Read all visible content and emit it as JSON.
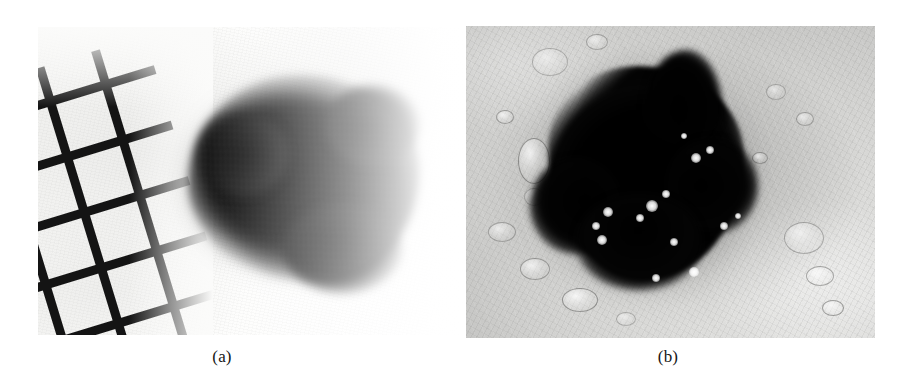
{
  "figure": {
    "kind": "two-panel-medical-figure",
    "background_color": "#ffffff",
    "panels": [
      {
        "id": "a",
        "caption": "(a)",
        "modality": "clinical-photograph",
        "subject": "pigmented skin lesion (melanoma) with measuring mesh grid",
        "background_color": "#fbfbfa",
        "lesion_color": "#0a0a0a",
        "has_measurement_grid": true,
        "grid_color": "#141414",
        "grid_rotation_deg": -17,
        "border_quality": "fuzzy, irregular, feathered",
        "rect": {
          "x": 38,
          "y": 27,
          "w": 427,
          "h": 308
        }
      },
      {
        "id": "b",
        "caption": "(b)",
        "modality": "dermoscopic-image",
        "subject": "same pigmented lesion under dermoscopy with immersion fluid bubbles",
        "background_color": "#d4d4d2",
        "lesion_color": "#000000",
        "has_measurement_grid": false,
        "border_quality": "sharp with focal fading at periphery",
        "rect": {
          "x": 466,
          "y": 26,
          "w": 409,
          "h": 312
        }
      }
    ]
  },
  "captions": {
    "a": "(a)",
    "b": "(b)"
  },
  "bubbles_panel_b": [
    {
      "x": 66,
      "y": 22,
      "w": 34,
      "h": 26,
      "type": "outline"
    },
    {
      "x": 120,
      "y": 8,
      "w": 20,
      "h": 14,
      "type": "outline"
    },
    {
      "x": 30,
      "y": 84,
      "w": 16,
      "h": 12,
      "type": "outline"
    },
    {
      "x": 52,
      "y": 112,
      "w": 30,
      "h": 44,
      "type": "outline"
    },
    {
      "x": 58,
      "y": 162,
      "w": 18,
      "h": 16,
      "type": "outline"
    },
    {
      "x": 22,
      "y": 196,
      "w": 26,
      "h": 18,
      "type": "outline"
    },
    {
      "x": 54,
      "y": 232,
      "w": 28,
      "h": 20,
      "type": "outline"
    },
    {
      "x": 96,
      "y": 262,
      "w": 34,
      "h": 22,
      "type": "outline"
    },
    {
      "x": 150,
      "y": 286,
      "w": 18,
      "h": 12,
      "type": "outline"
    },
    {
      "x": 318,
      "y": 196,
      "w": 38,
      "h": 30,
      "type": "outline"
    },
    {
      "x": 340,
      "y": 240,
      "w": 26,
      "h": 18,
      "type": "outline"
    },
    {
      "x": 356,
      "y": 274,
      "w": 20,
      "h": 14,
      "type": "outline"
    },
    {
      "x": 300,
      "y": 58,
      "w": 18,
      "h": 14,
      "type": "outline"
    },
    {
      "x": 330,
      "y": 86,
      "w": 16,
      "h": 12,
      "type": "outline"
    },
    {
      "x": 286,
      "y": 126,
      "w": 14,
      "h": 10,
      "type": "outline"
    }
  ],
  "sparks_panel_b": [
    {
      "x": 148,
      "y": 92,
      "r": 5
    },
    {
      "x": 162,
      "y": 84,
      "r": 4
    },
    {
      "x": 118,
      "y": 128,
      "r": 4
    },
    {
      "x": 104,
      "y": 140,
      "r": 6
    },
    {
      "x": 92,
      "y": 152,
      "r": 4
    },
    {
      "x": 60,
      "y": 146,
      "r": 5
    },
    {
      "x": 48,
      "y": 160,
      "r": 4
    },
    {
      "x": 54,
      "y": 174,
      "r": 5
    },
    {
      "x": 126,
      "y": 176,
      "r": 4
    },
    {
      "x": 176,
      "y": 160,
      "r": 4
    },
    {
      "x": 146,
      "y": 206,
      "r": 5
    },
    {
      "x": 108,
      "y": 212,
      "r": 4
    },
    {
      "x": 190,
      "y": 150,
      "r": 3
    },
    {
      "x": 136,
      "y": 70,
      "r": 3
    }
  ]
}
